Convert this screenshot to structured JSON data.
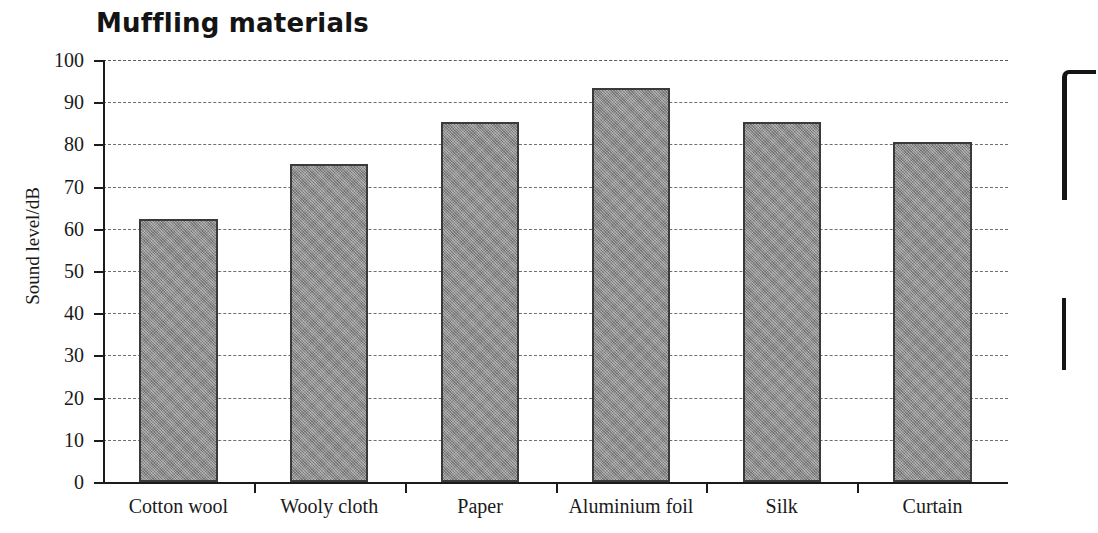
{
  "chart_data": {
    "type": "bar",
    "title": "Muffling materials",
    "xlabel": "",
    "ylabel": "Sound level/dB",
    "categories": [
      "Cotton wool",
      "Wooly cloth",
      "Paper",
      "Aluminium foil",
      "Silk",
      "Curtain"
    ],
    "values": [
      62.3,
      75.4,
      85.3,
      93.4,
      85.4,
      80.6
    ],
    "ylim": [
      0,
      100
    ],
    "ytick_step": 10,
    "yticks": [
      100,
      90,
      80,
      70,
      60,
      50,
      40,
      30,
      20,
      10,
      0
    ],
    "grid": true,
    "grid_axis": "y",
    "grid_style": "dashed",
    "legend": false,
    "legend_position": "none",
    "bar_color": "#8e8e8e",
    "bar_edge_color": "#3a3a3a",
    "axis_color": "#1b1b1b",
    "background_color": "#ffffff",
    "series": [
      {
        "name": "Sound level",
        "values": [
          62.3,
          75.4,
          85.3,
          93.4,
          85.4,
          80.6
        ]
      }
    ]
  },
  "annotations": {
    "scan_artifact": "partial-binder-clip-edge-right"
  }
}
